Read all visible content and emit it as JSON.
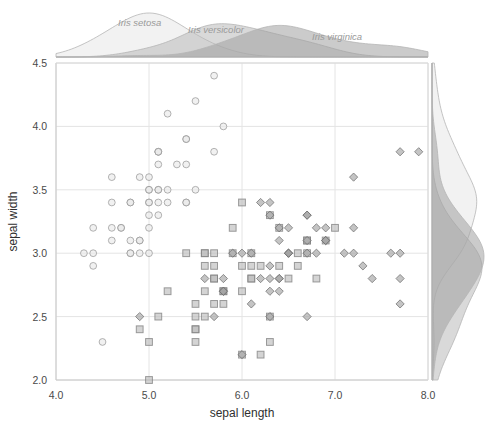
{
  "chart_data": {
    "type": "scatter",
    "title": "",
    "xlabel": "sepal length",
    "ylabel": "sepal width",
    "xlim": [
      4.0,
      8.0
    ],
    "ylim": [
      2.0,
      4.5
    ],
    "xticks": [
      "4.0",
      "5.0",
      "6.0",
      "7.0",
      "8.0"
    ],
    "xtick_values": [
      4.0,
      5.0,
      6.0,
      7.0,
      8.0
    ],
    "yticks": [
      "2.0",
      "2.5",
      "3.0",
      "3.5",
      "4.0",
      "4.5"
    ],
    "ytick_values": [
      2.0,
      2.5,
      3.0,
      3.5,
      4.0,
      4.5
    ],
    "grid": true,
    "legend_position": "inline-top-marginal",
    "marginal_distributions": {
      "top": "density of sepal length by species",
      "right": "density of sepal width by species"
    },
    "series": [
      {
        "name": "Iris setosa",
        "marker": "circle",
        "color": "#e8e8e8",
        "stroke": "#9a9a9a",
        "label_x": 118,
        "label_y": 26,
        "points": [
          [
            5.1,
            3.5
          ],
          [
            4.9,
            3.0
          ],
          [
            4.7,
            3.2
          ],
          [
            4.6,
            3.1
          ],
          [
            5.0,
            3.6
          ],
          [
            5.4,
            3.9
          ],
          [
            4.6,
            3.4
          ],
          [
            5.0,
            3.4
          ],
          [
            4.4,
            2.9
          ],
          [
            4.9,
            3.1
          ],
          [
            5.4,
            3.7
          ],
          [
            4.8,
            3.4
          ],
          [
            4.8,
            3.0
          ],
          [
            4.3,
            3.0
          ],
          [
            5.8,
            4.0
          ],
          [
            5.7,
            4.4
          ],
          [
            5.4,
            3.9
          ],
          [
            5.1,
            3.5
          ],
          [
            5.7,
            3.8
          ],
          [
            5.1,
            3.8
          ],
          [
            5.4,
            3.4
          ],
          [
            5.1,
            3.7
          ],
          [
            4.6,
            3.6
          ],
          [
            5.1,
            3.3
          ],
          [
            4.8,
            3.4
          ],
          [
            5.0,
            3.0
          ],
          [
            5.0,
            3.4
          ],
          [
            5.2,
            3.5
          ],
          [
            5.2,
            3.4
          ],
          [
            4.7,
            3.2
          ],
          [
            4.8,
            3.1
          ],
          [
            5.4,
            3.4
          ],
          [
            5.2,
            4.1
          ],
          [
            5.5,
            4.2
          ],
          [
            4.9,
            3.1
          ],
          [
            5.0,
            3.2
          ],
          [
            5.5,
            3.5
          ],
          [
            4.9,
            3.6
          ],
          [
            4.4,
            3.0
          ],
          [
            5.1,
            3.4
          ],
          [
            5.0,
            3.5
          ],
          [
            4.5,
            2.3
          ],
          [
            4.4,
            3.2
          ],
          [
            5.0,
            3.5
          ],
          [
            5.1,
            3.8
          ],
          [
            4.8,
            3.0
          ],
          [
            5.1,
            3.8
          ],
          [
            4.6,
            3.2
          ],
          [
            5.3,
            3.7
          ],
          [
            5.0,
            3.3
          ]
        ]
      },
      {
        "name": "Iris versicolor",
        "marker": "square",
        "color": "#b9b9b9",
        "stroke": "#7d7d7d",
        "label_x": 188,
        "label_y": 33,
        "points": [
          [
            7.0,
            3.2
          ],
          [
            6.4,
            3.2
          ],
          [
            6.9,
            3.1
          ],
          [
            5.5,
            2.3
          ],
          [
            6.5,
            2.8
          ],
          [
            5.7,
            2.8
          ],
          [
            6.3,
            3.3
          ],
          [
            4.9,
            2.4
          ],
          [
            6.6,
            2.9
          ],
          [
            5.2,
            2.7
          ],
          [
            5.0,
            2.0
          ],
          [
            5.9,
            3.0
          ],
          [
            6.0,
            2.2
          ],
          [
            6.1,
            2.9
          ],
          [
            5.6,
            2.9
          ],
          [
            6.7,
            3.1
          ],
          [
            5.6,
            3.0
          ],
          [
            5.8,
            2.7
          ],
          [
            6.2,
            2.2
          ],
          [
            5.6,
            2.5
          ],
          [
            5.9,
            3.2
          ],
          [
            6.1,
            2.8
          ],
          [
            6.3,
            2.5
          ],
          [
            6.1,
            2.8
          ],
          [
            6.4,
            2.9
          ],
          [
            6.6,
            3.0
          ],
          [
            6.8,
            2.8
          ],
          [
            6.7,
            3.0
          ],
          [
            6.0,
            2.9
          ],
          [
            5.7,
            2.6
          ],
          [
            5.5,
            2.4
          ],
          [
            5.5,
            2.4
          ],
          [
            5.8,
            2.7
          ],
          [
            6.0,
            2.7
          ],
          [
            5.4,
            3.0
          ],
          [
            6.0,
            3.4
          ],
          [
            6.7,
            3.1
          ],
          [
            6.3,
            2.3
          ],
          [
            5.6,
            3.0
          ],
          [
            5.5,
            2.5
          ],
          [
            5.5,
            2.6
          ],
          [
            6.1,
            3.0
          ],
          [
            5.8,
            2.6
          ],
          [
            5.0,
            2.3
          ],
          [
            5.6,
            2.7
          ],
          [
            5.7,
            3.0
          ],
          [
            5.7,
            2.9
          ],
          [
            6.2,
            2.9
          ],
          [
            5.1,
            2.5
          ],
          [
            5.7,
            2.8
          ]
        ]
      },
      {
        "name": "Iris virginica",
        "marker": "diamond",
        "color": "#a0a0a0",
        "stroke": "#6f6f6f",
        "label_x": 312,
        "label_y": 40,
        "points": [
          [
            6.3,
            3.3
          ],
          [
            5.8,
            2.7
          ],
          [
            7.1,
            3.0
          ],
          [
            6.3,
            2.9
          ],
          [
            6.5,
            3.0
          ],
          [
            7.6,
            3.0
          ],
          [
            4.9,
            2.5
          ],
          [
            7.3,
            2.9
          ],
          [
            6.7,
            2.5
          ],
          [
            7.2,
            3.6
          ],
          [
            6.5,
            3.2
          ],
          [
            6.4,
            2.7
          ],
          [
            6.8,
            3.0
          ],
          [
            5.7,
            2.5
          ],
          [
            5.8,
            2.8
          ],
          [
            6.4,
            3.2
          ],
          [
            6.5,
            3.0
          ],
          [
            7.7,
            3.8
          ],
          [
            7.7,
            2.6
          ],
          [
            6.0,
            2.2
          ],
          [
            6.9,
            3.2
          ],
          [
            5.6,
            2.8
          ],
          [
            7.7,
            2.8
          ],
          [
            6.3,
            2.7
          ],
          [
            6.7,
            3.3
          ],
          [
            7.2,
            3.2
          ],
          [
            6.2,
            2.8
          ],
          [
            6.1,
            3.0
          ],
          [
            6.4,
            2.8
          ],
          [
            7.2,
            3.0
          ],
          [
            7.4,
            2.8
          ],
          [
            7.9,
            3.8
          ],
          [
            6.4,
            2.8
          ],
          [
            6.3,
            2.8
          ],
          [
            6.1,
            2.6
          ],
          [
            7.7,
            3.0
          ],
          [
            6.3,
            3.4
          ],
          [
            6.4,
            3.1
          ],
          [
            6.0,
            3.0
          ],
          [
            6.9,
            3.1
          ],
          [
            6.7,
            3.1
          ],
          [
            6.9,
            3.1
          ],
          [
            5.8,
            2.7
          ],
          [
            6.8,
            3.2
          ],
          [
            6.7,
            3.3
          ],
          [
            6.7,
            3.0
          ],
          [
            6.3,
            2.5
          ],
          [
            6.5,
            3.0
          ],
          [
            6.2,
            3.4
          ],
          [
            5.9,
            3.0
          ]
        ]
      }
    ]
  }
}
